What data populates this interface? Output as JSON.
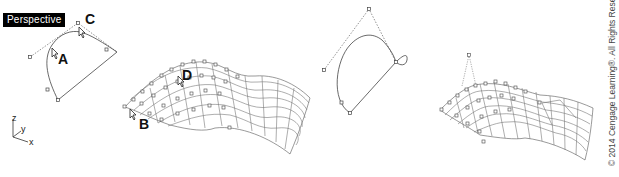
{
  "viewport": {
    "label": "Perspective"
  },
  "callouts": {
    "a": "A",
    "b": "B",
    "c": "C",
    "d": "D"
  },
  "axes": {
    "z": "z",
    "y": "y",
    "x": "x"
  },
  "copyright": "© 2014 Cengage Learning®. All Rights Reserved.",
  "panels": [
    {
      "id": "curve-edit-1",
      "description": "Curve with control polygon, callouts A and C"
    },
    {
      "id": "surface-1",
      "description": "Wireframe surface with control points, callouts B and D"
    },
    {
      "id": "curve-edit-2",
      "description": "Edited curve with control polygon and loop"
    },
    {
      "id": "surface-2",
      "description": "Wireframe surface with a pulled control point forming a peak"
    }
  ]
}
